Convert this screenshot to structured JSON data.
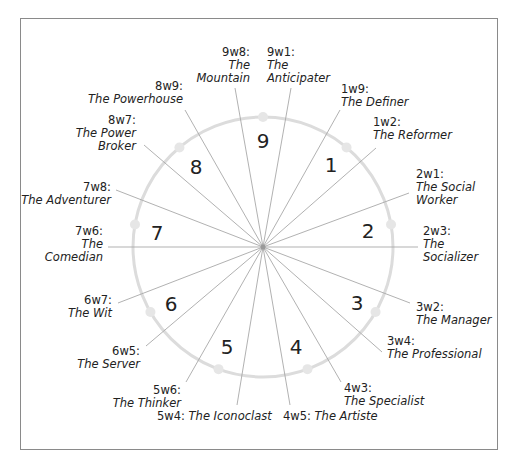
{
  "diagram": {
    "types": [
      "9",
      "1",
      "2",
      "3",
      "4",
      "5",
      "6",
      "7",
      "8"
    ],
    "wings": [
      {
        "code": "9w8:",
        "name": "The Mountain"
      },
      {
        "code": "9w1:",
        "name": "The Anticipater"
      },
      {
        "code": "1w9:",
        "name": "The Definer"
      },
      {
        "code": "1w2:",
        "name": "The Reformer"
      },
      {
        "code": "2w1:",
        "name": "The Social Worker"
      },
      {
        "code": "2w3:",
        "name": "The Socializer"
      },
      {
        "code": "3w2:",
        "name": "The Manager"
      },
      {
        "code": "3w4:",
        "name": "The Professional"
      },
      {
        "code": "4w3:",
        "name": "The Specialist"
      },
      {
        "code": "4w5:",
        "name": "The Artiste"
      },
      {
        "code": "5w4:",
        "name": "The Iconoclast"
      },
      {
        "code": "5w6:",
        "name": "The Thinker"
      },
      {
        "code": "6w5:",
        "name": "The Server"
      },
      {
        "code": "6w7:",
        "name": "The Wit"
      },
      {
        "code": "7w6:",
        "name": "The Comedian"
      },
      {
        "code": "7w8:",
        "name": "The Adventurer"
      },
      {
        "code": "8w7:",
        "name": "The Power Broker"
      },
      {
        "code": "8w9:",
        "name": "The Powerhouse"
      }
    ],
    "colors": {
      "circle": "#dcdcdc",
      "spoke": "#a0a0a0",
      "frame": "#8a8a8a",
      "text": "#222222"
    }
  }
}
